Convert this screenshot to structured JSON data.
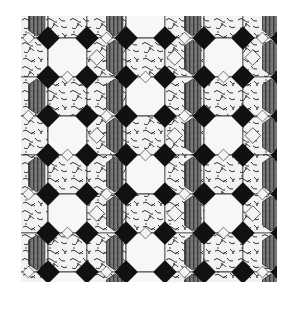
{
  "image": {
    "description": "Decorative floor tile pattern: octagons with black diamond insets, marbled and striped tiles",
    "colors": {
      "background": "#ffffff",
      "black_diamond": "#111111",
      "plain_octagon": "#f7f7f7",
      "marble_base": "#f2f2f2",
      "marble_vein": "#333333",
      "stripe_base": "#7a7a7a",
      "stripe_line": "#3a3a3a",
      "small_diamond": "#f4f4f4",
      "outline": "#222222"
    },
    "pattern": {
      "origin_x": -12,
      "origin_y": -17,
      "cell": 39,
      "rows": 8,
      "cols": 8,
      "grid": [
        [
          "S",
          "M",
          "S",
          "P",
          "S",
          "M",
          "S",
          "M"
        ],
        [
          "M",
          "P",
          "X",
          "M",
          "X",
          "P",
          "X",
          "M"
        ],
        [
          "S",
          "M",
          "S",
          "P",
          "S",
          "M",
          "S",
          "P"
        ],
        [
          "M",
          "P",
          "X",
          "M",
          "X",
          "P",
          "X",
          "M"
        ],
        [
          "S",
          "M",
          "S",
          "P",
          "S",
          "M",
          "S",
          "P"
        ],
        [
          "M",
          "P",
          "X",
          "M",
          "X",
          "P",
          "X",
          "M"
        ],
        [
          "S",
          "M",
          "S",
          "P",
          "S",
          "M",
          "S",
          "P"
        ],
        [
          "M",
          "P",
          "X",
          "P",
          "X",
          "M",
          "X",
          "M"
        ]
      ],
      "legend": {
        "P": "plain white octagon",
        "M": "marbled octagon",
        "S": "striped gray elongated hexagon with marble side",
        "X": "marble cell with striped hexagon and small white diamond"
      }
    }
  }
}
